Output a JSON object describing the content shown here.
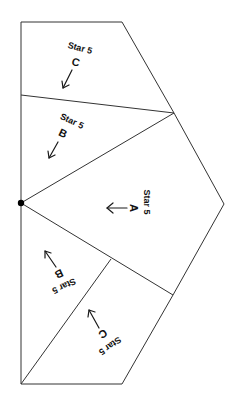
{
  "diagram": {
    "line_color": "#333333",
    "text_color": "#111111",
    "vertices": {
      "top_left": [
        21,
        22
      ],
      "top_right": [
        122,
        22
      ],
      "upper_right": [
        174,
        113
      ],
      "right_point": [
        224,
        204
      ],
      "lower_right": [
        173,
        295
      ],
      "bottom_right": [
        122,
        384
      ],
      "bottom_left": [
        21,
        384
      ],
      "left_mid_upper": [
        21,
        95
      ],
      "center_dot": [
        21,
        203
      ],
      "inner_junction": [
        111,
        259
      ]
    },
    "pieces": [
      {
        "id": "C-top",
        "label": "Star 5",
        "letter": "C",
        "arrow": "down-left"
      },
      {
        "id": "B-top",
        "label": "Star 5",
        "letter": "B",
        "arrow": "down-left"
      },
      {
        "id": "A",
        "label": "Star 5",
        "letter": "A",
        "arrow": "left"
      },
      {
        "id": "B-bottom",
        "label": "Star 5",
        "letter": "B",
        "arrow": "up-left"
      },
      {
        "id": "C-bottom",
        "label": "Star 5",
        "letter": "C",
        "arrow": "up-left"
      }
    ]
  }
}
